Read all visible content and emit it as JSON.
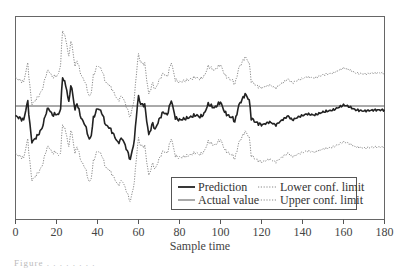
{
  "chart_data": {
    "type": "line",
    "title": "",
    "xlabel": "Sample time",
    "ylabel": "",
    "xlim": [
      0,
      180
    ],
    "x_ticks": [
      0,
      20,
      40,
      60,
      80,
      100,
      120,
      140,
      160,
      180
    ],
    "y_ticks": [],
    "grid": false,
    "legend_position": "lower right",
    "legend": [
      "Prediction",
      "Actual value",
      "Lower conf. limit",
      "Upper conf. limit"
    ],
    "series": [
      {
        "name": "Prediction",
        "style": "solid-thick",
        "color": "#222222",
        "x": [
          0,
          2,
          4,
          5,
          6,
          7,
          8,
          9,
          11,
          13,
          15,
          16,
          18,
          20,
          21,
          22,
          23,
          24,
          25,
          26,
          27,
          28,
          29,
          30,
          32,
          34,
          36,
          37,
          38,
          40,
          42,
          44,
          46,
          48,
          50,
          52,
          54,
          56,
          57,
          58,
          59,
          60,
          61,
          63,
          64,
          65,
          67,
          68,
          70,
          72,
          74,
          76,
          78,
          80,
          84,
          88,
          90,
          92,
          94,
          97,
          100,
          102,
          104,
          106,
          107,
          109,
          111,
          112,
          114,
          115,
          117,
          120,
          124,
          127,
          130,
          133,
          135,
          138,
          142,
          146,
          150,
          155,
          160,
          162,
          166,
          170,
          175,
          180
        ],
        "y": [
          -1.0,
          -1.2,
          -1.4,
          -0.4,
          0.5,
          -1.9,
          -3.6,
          -3.4,
          -2.9,
          -2.2,
          -0.6,
          -0.2,
          -0.9,
          -0.8,
          -0.9,
          -0.2,
          2.9,
          2.4,
          1.6,
          0.3,
          2.1,
          1.1,
          -0.4,
          0.3,
          -1.2,
          -1.9,
          -3.4,
          -2.9,
          -1.2,
          -0.2,
          -0.6,
          -1.9,
          -2.2,
          -2.9,
          -3.7,
          -3.2,
          -4.2,
          -5.4,
          -4.4,
          -3.4,
          -0.9,
          1.0,
          0.2,
          0.1,
          -1.4,
          -2.9,
          -1.7,
          -2.4,
          -1.4,
          -0.6,
          -0.9,
          0.6,
          -1.2,
          -1.4,
          -1.2,
          -0.9,
          -1.1,
          -0.8,
          0.2,
          -0.2,
          0.4,
          -0.6,
          -1.0,
          -1.2,
          -1.6,
          0.1,
          0.8,
          1.2,
          0.6,
          -1.2,
          -1.6,
          -1.9,
          -1.6,
          -1.9,
          -1.4,
          -1.0,
          -1.4,
          -1.1,
          -0.8,
          -0.9,
          -0.6,
          -0.4,
          0.1,
          0.0,
          -0.4,
          -0.5,
          -0.4,
          -0.4
        ]
      },
      {
        "name": "Actual value",
        "style": "solid-thin",
        "color": "#555555",
        "x": [
          0,
          180
        ],
        "y": [
          0,
          0
        ]
      },
      {
        "name": "Lower conf. limit",
        "style": "dotted",
        "color": "#777777",
        "offset_from_prediction": [
          -4.0,
          -3.7
        ]
      },
      {
        "name": "Upper conf. limit",
        "style": "dotted",
        "color": "#777777",
        "offset_from_prediction": [
          4.0,
          3.7
        ]
      }
    ],
    "band_halfwidth": {
      "x": [
        0,
        20,
        23,
        30,
        60,
        75,
        120,
        180
      ],
      "w": [
        3.8,
        3.8,
        4.7,
        4.3,
        4.2,
        3.8,
        3.7,
        3.7
      ]
    }
  },
  "legend": {
    "prediction": "Prediction",
    "actual": "Actual value",
    "lower": "Lower conf. limit",
    "upper": "Upper conf. limit"
  },
  "axis": {
    "xlabel": "Sample time",
    "ticks": [
      "0",
      "20",
      "40",
      "60",
      "80",
      "100",
      "120",
      "140",
      "160",
      "180"
    ]
  },
  "caption": "Figure . . . . . . . ."
}
